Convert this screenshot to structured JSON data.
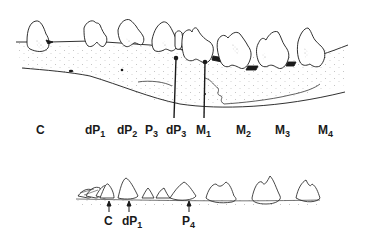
{
  "figure": {
    "upper_jaw": {
      "labels": [
        {
          "base": "C",
          "sub": ""
        },
        {
          "base": "dP",
          "sub": "1"
        },
        {
          "base": "dP",
          "sub": "2"
        },
        {
          "base": "P",
          "sub": "3"
        },
        {
          "base": "dP",
          "sub": "3"
        },
        {
          "base": "M",
          "sub": "1"
        },
        {
          "base": "M",
          "sub": "2"
        },
        {
          "base": "M",
          "sub": "3"
        },
        {
          "base": "M",
          "sub": "4"
        }
      ]
    },
    "lower_row": {
      "labels": [
        {
          "base": "C",
          "sub": ""
        },
        {
          "base": "dP",
          "sub": "1"
        },
        {
          "base": "P",
          "sub": "4"
        }
      ]
    },
    "colors": {
      "ink": "#1a1a1a",
      "bone_stipple": "#8a8a8a",
      "background": "#ffffff"
    }
  }
}
